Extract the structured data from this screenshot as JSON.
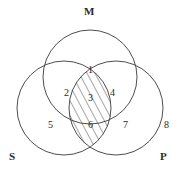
{
  "figure": {
    "type": "venn-diagram",
    "set_count": 3,
    "background_color": "#ffffff",
    "stroke_color": "#3a3a3a",
    "text_color": "#2b2b2b"
  },
  "sets": [
    {
      "name": "set-m",
      "label": "M",
      "label_x": 84,
      "label_y": 6,
      "cx": 90,
      "cy": 77,
      "r": 47
    },
    {
      "name": "set-s",
      "label": "S",
      "label_x": 9,
      "label_y": 151,
      "cx": 64,
      "cy": 108,
      "r": 47
    },
    {
      "name": "set-p",
      "label": "P",
      "label_x": 160,
      "label_y": 151,
      "cx": 116,
      "cy": 108,
      "r": 47
    }
  ],
  "regions": [
    {
      "name": "region-m-only",
      "label": "1",
      "x": 88,
      "y": 65
    },
    {
      "name": "region-m-s",
      "label": "2",
      "x": 64,
      "y": 88
    },
    {
      "name": "region-m-s-p",
      "label": "3",
      "x": 88,
      "y": 93
    },
    {
      "name": "region-m-p",
      "label": "4",
      "x": 110,
      "y": 88
    },
    {
      "name": "region-s-only",
      "label": "5",
      "x": 48,
      "y": 120
    },
    {
      "name": "region-s-p",
      "label": "6",
      "x": 88,
      "y": 120
    },
    {
      "name": "region-p-only",
      "label": "7",
      "x": 123,
      "y": 120
    },
    {
      "name": "region-outside",
      "label": "8",
      "x": 164,
      "y": 120
    }
  ],
  "shading": {
    "name": "hatched-region",
    "description": "S intersect P lens shaded with diagonal hatch lines",
    "pattern": "diagonal-hatch",
    "direction": "lower-left-to-upper-right",
    "line_color": "#3a3a3a"
  }
}
